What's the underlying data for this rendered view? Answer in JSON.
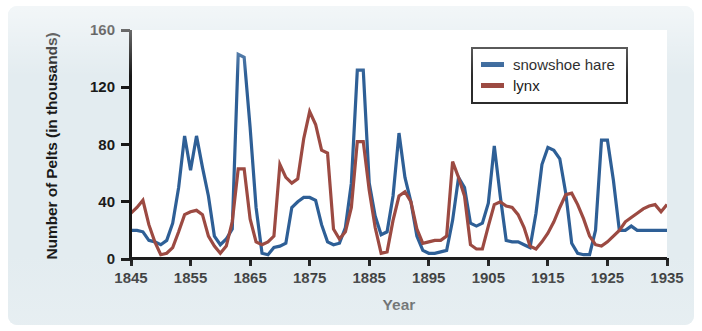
{
  "figure": {
    "background_color": "#e3ecf0",
    "plot_background_color": "#ffffff",
    "axis_color": "#171717"
  },
  "legend": {
    "position": "top-right",
    "entries": [
      {
        "label": "snowshoe hare",
        "color": "#2e5f96"
      },
      {
        "label": "lynx",
        "color": "#9c4a42"
      }
    ]
  },
  "chart_data": {
    "type": "line",
    "title": "",
    "xlabel": "Year",
    "ylabel": "Number of Pelts (in thousands)",
    "xlim": [
      1845,
      1935
    ],
    "ylim": [
      0,
      160
    ],
    "xticks": [
      1845,
      1855,
      1865,
      1875,
      1885,
      1895,
      1905,
      1915,
      1925,
      1935
    ],
    "yticks": [
      0,
      40,
      80,
      120,
      160
    ],
    "grid": false,
    "legend_position": "top-right",
    "x": [
      1845,
      1846,
      1847,
      1848,
      1849,
      1850,
      1851,
      1852,
      1853,
      1854,
      1855,
      1856,
      1857,
      1858,
      1859,
      1860,
      1861,
      1862,
      1863,
      1864,
      1865,
      1866,
      1867,
      1868,
      1869,
      1870,
      1871,
      1872,
      1873,
      1874,
      1875,
      1876,
      1877,
      1878,
      1879,
      1880,
      1881,
      1882,
      1883,
      1884,
      1885,
      1886,
      1887,
      1888,
      1889,
      1890,
      1891,
      1892,
      1893,
      1894,
      1895,
      1896,
      1897,
      1898,
      1899,
      1900,
      1901,
      1902,
      1903,
      1904,
      1905,
      1906,
      1907,
      1908,
      1909,
      1910,
      1911,
      1912,
      1913,
      1914,
      1915,
      1916,
      1917,
      1918,
      1919,
      1920,
      1921,
      1922,
      1923,
      1924,
      1925,
      1926,
      1927,
      1928,
      1929,
      1930,
      1931,
      1932,
      1933,
      1934,
      1935
    ],
    "series": [
      {
        "name": "snowshoe hare",
        "color": "#2e5f96",
        "values": [
          20,
          20,
          19,
          13,
          12,
          10,
          13,
          25,
          50,
          86,
          62,
          86,
          64,
          44,
          16,
          10,
          14,
          21,
          143,
          141,
          92,
          36,
          4,
          3,
          8,
          9,
          11,
          36,
          40,
          43,
          43,
          41,
          24,
          12,
          10,
          11,
          22,
          53,
          132,
          132,
          53,
          30,
          17,
          19,
          44,
          88,
          57,
          40,
          16,
          6,
          4,
          4,
          5,
          6,
          27,
          57,
          50,
          25,
          23,
          25,
          39,
          79,
          44,
          13,
          12,
          12,
          10,
          8,
          32,
          66,
          78,
          76,
          70,
          46,
          11,
          4,
          3,
          3,
          20,
          83,
          83,
          55,
          20,
          20,
          23,
          20,
          20,
          20,
          20,
          20,
          20
        ]
      },
      {
        "name": "lynx",
        "color": "#9c4a42",
        "values": [
          32,
          36,
          41,
          24,
          12,
          3,
          4,
          8,
          19,
          31,
          33,
          34,
          31,
          16,
          9,
          4,
          9,
          26,
          63,
          63,
          28,
          12,
          10,
          12,
          16,
          66,
          57,
          53,
          56,
          84,
          103,
          94,
          76,
          74,
          21,
          14,
          19,
          36,
          82,
          82,
          48,
          22,
          4,
          5,
          27,
          44,
          47,
          40,
          21,
          11,
          12,
          13,
          13,
          16,
          68,
          57,
          44,
          10,
          7,
          7,
          23,
          38,
          40,
          37,
          36,
          31,
          22,
          9,
          7,
          12,
          18,
          26,
          36,
          45,
          46,
          38,
          28,
          16,
          10,
          9,
          12,
          16,
          20,
          26,
          29,
          32,
          35,
          37,
          38,
          33,
          38
        ]
      }
    ]
  }
}
